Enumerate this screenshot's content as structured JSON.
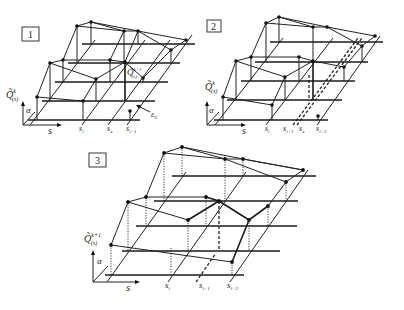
{
  "panels": [
    {
      "id": "1",
      "label": "1",
      "axis_y": "Q̃",
      "axis_y_sup": "k",
      "axis_y_sub": "(s)",
      "axis_x": "s",
      "axis_alpha": "α",
      "s_labels": [
        "s",
        "s",
        "s"
      ],
      "s_subs": [
        "i",
        "e",
        "i+1"
      ],
      "inner_label": "Q̃",
      "inner_sup": "k+1",
      "inner_sub": "(s)",
      "eps_label": "ε",
      "eps_sub": "S"
    },
    {
      "id": "2",
      "label": "2",
      "axis_y": "Q̃",
      "axis_y_sup": "k",
      "axis_y_sub": "(s)",
      "axis_x": "s",
      "axis_alpha": "α",
      "s_labels": [
        "s",
        "s",
        "s",
        "s"
      ],
      "s_subs": [
        "i",
        "i+1",
        "e",
        "i+2"
      ]
    },
    {
      "id": "3",
      "label": "3",
      "axis_y": "Q̃",
      "axis_y_sup": "k+1",
      "axis_y_sub": "(s)",
      "axis_x": "s",
      "axis_alpha": "α",
      "s_labels": [
        "s",
        "s",
        "s"
      ],
      "s_subs": [
        "i",
        "i+1",
        "i+2"
      ]
    }
  ]
}
